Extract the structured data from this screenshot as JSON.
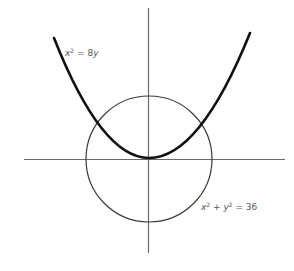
{
  "figure": {
    "type": "diagram",
    "colors": {
      "background": "#ffffff",
      "axes": "#6a6a6a",
      "circle": "#3a3a3a",
      "parabola": "#111111",
      "label": "#555555"
    },
    "axes": {
      "origin_px": [
        149,
        159
      ],
      "x_axis_px": [
        24,
        285
      ],
      "y_axis_px": [
        8,
        253
      ]
    },
    "curves": [
      {
        "name": "parabola",
        "equation": "x^2 = 8y",
        "label": {
          "var1": "x",
          "exp1": "2",
          "rest": " = 8",
          "var2": "y"
        },
        "stroke_width": 2.6
      },
      {
        "name": "circle",
        "equation": "x^2 + y^2 = 36",
        "radius_units": 6,
        "radius_px": 63,
        "label": {
          "var1": "x",
          "exp1": "2",
          "plus": " + ",
          "var2": "y",
          "exp2": "2",
          "rest": " = 36"
        },
        "stroke_width": 1.2
      }
    ]
  }
}
